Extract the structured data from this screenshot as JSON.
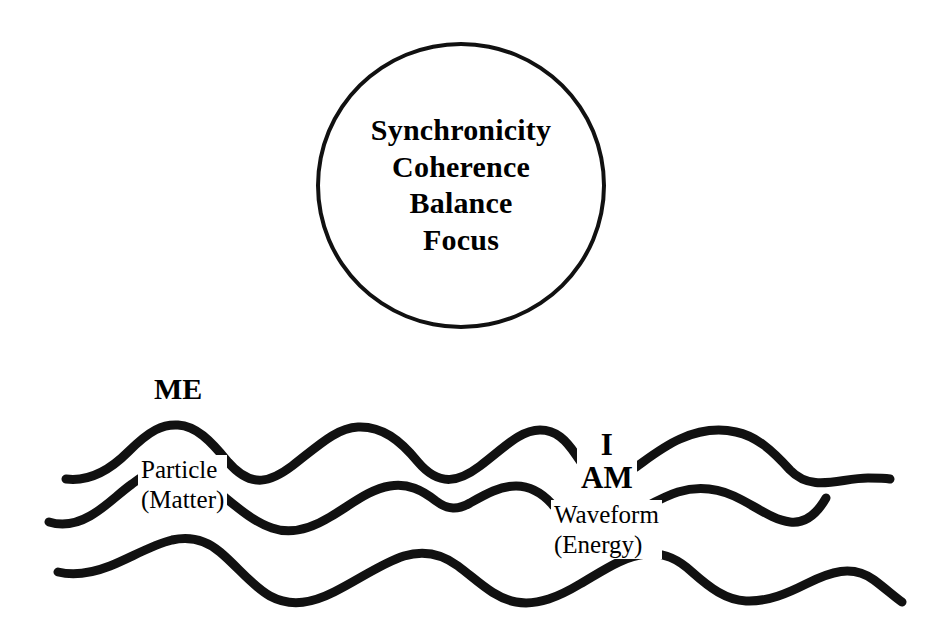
{
  "canvas": {
    "width": 949,
    "height": 637,
    "background": "#ffffff",
    "ink": "#111111"
  },
  "circle": {
    "name": "state-circle",
    "stroke": "#111111",
    "lines": [
      {
        "text": "Synchronicity"
      },
      {
        "text": "Coherence"
      },
      {
        "text": "Balance"
      },
      {
        "text": "Focus"
      }
    ]
  },
  "diagram": {
    "title": "",
    "labels": {
      "me": "ME",
      "particle_line1": "Particle",
      "particle_line2": "(Matter)",
      "i": "I",
      "am": "AM",
      "waveform_line1": "Waveform",
      "waveform_line2": "(Energy)"
    },
    "waves": [
      {
        "name": "wave-top",
        "segments": [
          "M 66 479 C 90 482 110 470 128 452 C 150 430 163 424 178 425 C 196 426 210 440 228 462 C 252 490 272 481 292 466 C 318 446 336 428 358 427 C 382 426 400 440 418 462 C 440 488 460 481 480 466 C 504 448 520 430 540 430 C 556 430 566 440 576 455 C 582 464 586 469 590 473",
          "M 636 467 C 650 457 664 446 680 439 C 700 430 718 428 736 432 C 756 436 772 450 790 470 C 812 493 840 478 868 478 C 878 478 884 478 890 479"
        ]
      },
      {
        "name": "wave-middle",
        "segments": [
          "M 49 522 C 62 526 76 524 90 516 C 106 507 118 494 132 484 C 140 478 146 474 152 471",
          "M 222 495 C 238 508 254 522 272 528 C 292 535 312 528 330 517 C 352 504 370 489 390 486 C 408 483 422 490 436 501 C 448 510 458 510 470 503 C 486 494 500 486 516 486 C 530 486 542 493 552 504 C 558 511 562 516 566 520",
          "M 632 514 C 648 506 662 497 678 492 C 698 486 716 488 734 496 C 754 505 772 520 790 522 C 806 524 818 512 826 498"
        ]
      },
      {
        "name": "wave-bottom",
        "segments": [
          "M 58 572 C 74 576 92 573 110 566 C 132 557 152 545 172 540 C 190 536 206 540 220 552 C 238 567 252 586 270 596 C 292 608 314 602 334 592 C 360 579 382 563 404 556 C 424 550 442 554 458 566 C 478 581 494 598 516 602 C 538 606 560 596 580 584 C 604 570 624 556 646 554 C 664 552 678 559 692 572 C 710 588 726 600 746 601 C 768 602 788 593 806 584 C 830 572 852 564 874 580 C 886 589 896 598 902 602"
        ]
      }
    ]
  }
}
